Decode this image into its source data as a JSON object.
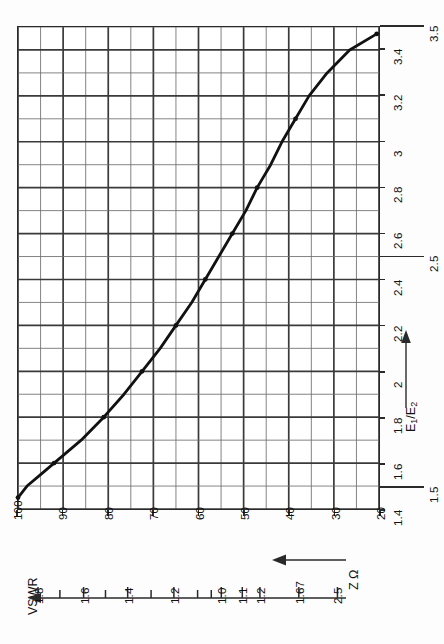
{
  "chart_data": {
    "type": "line",
    "title": "",
    "orientation": "rotated-90",
    "xlabel": "E1/E2",
    "ylabel": "Z Ω",
    "xlim": [
      1.4,
      3.5
    ],
    "ylim": [
      20,
      100
    ],
    "grid": true,
    "legend": "none",
    "x_tick_labels": [
      "1.4",
      "1.5",
      "1.6",
      "1.8",
      "2",
      "2.2",
      "2.4",
      "2.5",
      "2.6",
      "2.8",
      "3",
      "3.2",
      "3.4",
      "3.5"
    ],
    "x_tick_values": [
      1.4,
      1.5,
      1.6,
      1.8,
      2.0,
      2.2,
      2.4,
      2.5,
      2.6,
      2.8,
      3.0,
      3.2,
      3.4,
      3.5
    ],
    "y_tick_labels": [
      "100",
      "90",
      "80",
      "70",
      "60",
      "50",
      "40",
      "30",
      "20"
    ],
    "y_tick_values": [
      100,
      90,
      80,
      70,
      60,
      50,
      40,
      30,
      20
    ],
    "x_major_step": 0.2,
    "x_minor_step": 0.1,
    "y_major_step": 10,
    "y_minor_step": 5,
    "series": [
      {
        "name": "Z vs E1/E2",
        "x": [
          1.45,
          1.5,
          1.55,
          1.6,
          1.65,
          1.7,
          1.75,
          1.8,
          1.9,
          2.0,
          2.1,
          2.2,
          2.3,
          2.4,
          2.5,
          2.6,
          2.7,
          2.8,
          2.9,
          3.0,
          3.1,
          3.2,
          3.3,
          3.4,
          3.47
        ],
        "y": [
          100,
          98,
          95,
          92,
          89,
          86,
          83.5,
          81,
          76.5,
          72.5,
          68.5,
          65,
          61.5,
          58.5,
          55.5,
          52.5,
          49.5,
          47,
          44,
          41.5,
          38.5,
          35.5,
          31.5,
          26.5,
          20.5
        ],
        "markers_x": [
          1.45,
          1.6,
          1.8,
          2.0,
          2.2,
          2.4,
          2.6,
          2.8,
          3.1,
          3.47
        ],
        "markers_y": [
          100,
          92,
          81,
          72.5,
          65,
          58.5,
          52.5,
          47,
          38.5,
          20.5
        ]
      }
    ]
  },
  "axes": {
    "x_axis": {
      "name": "E1/E2",
      "label_main": "E",
      "label_sub1": "1",
      "label_mid": "/E",
      "label_sub2": "2",
      "arrow": "arrow-up-icon",
      "ticks": [
        {
          "value": 1.4,
          "label": "1.4",
          "extended": false
        },
        {
          "value": 1.5,
          "label": "1.5",
          "extended": true
        },
        {
          "value": 1.6,
          "label": "1.6",
          "extended": false
        },
        {
          "value": 1.8,
          "label": "1.8",
          "extended": false
        },
        {
          "value": 2.0,
          "label": "2",
          "extended": false
        },
        {
          "value": 2.2,
          "label": "2.2",
          "extended": false
        },
        {
          "value": 2.4,
          "label": "2.4",
          "extended": false
        },
        {
          "value": 2.5,
          "label": "2.5",
          "extended": true
        },
        {
          "value": 2.6,
          "label": "2.6",
          "extended": false
        },
        {
          "value": 2.8,
          "label": "2.8",
          "extended": false
        },
        {
          "value": 3.0,
          "label": "3",
          "extended": false
        },
        {
          "value": 3.2,
          "label": "3.2",
          "extended": false
        },
        {
          "value": 3.4,
          "label": "3.4",
          "extended": false
        },
        {
          "value": 3.5,
          "label": "3.5",
          "extended": true
        }
      ]
    },
    "y_axis": {
      "name": "Z Ω",
      "label": "Z Ω",
      "arrow": "arrow-left-icon",
      "ticks": [
        {
          "value": 100,
          "label": "100"
        },
        {
          "value": 90,
          "label": "90"
        },
        {
          "value": 80,
          "label": "80"
        },
        {
          "value": 70,
          "label": "70"
        },
        {
          "value": 60,
          "label": "60"
        },
        {
          "value": 50,
          "label": "50"
        },
        {
          "value": 40,
          "label": "40"
        },
        {
          "value": 30,
          "label": "30"
        },
        {
          "value": 20,
          "label": "20"
        }
      ]
    }
  },
  "vswr_scale": {
    "label": "VSWR",
    "arrow": "arrow-left-icon",
    "ticks": [
      {
        "pos": 0.0,
        "label": "1.8",
        "major": true
      },
      {
        "pos": 0.072,
        "label": "",
        "major": false
      },
      {
        "pos": 0.15,
        "label": "1.6",
        "major": true
      },
      {
        "pos": 0.222,
        "label": "",
        "major": false
      },
      {
        "pos": 0.295,
        "label": "1.4",
        "major": true
      },
      {
        "pos": 0.372,
        "label": "",
        "major": false
      },
      {
        "pos": 0.447,
        "label": "1.2",
        "major": true
      },
      {
        "pos": 0.525,
        "label": "",
        "major": false
      },
      {
        "pos": 0.57,
        "label": "",
        "major": false
      },
      {
        "pos": 0.603,
        "label": "1.0",
        "major": true
      },
      {
        "pos": 0.672,
        "label": "1.1",
        "major": true
      },
      {
        "pos": 0.73,
        "label": "1.2",
        "major": true
      },
      {
        "pos": 0.858,
        "label": "1.67",
        "major": true
      },
      {
        "pos": 0.985,
        "label": "2.5",
        "major": true
      }
    ]
  },
  "style": {
    "ink": "#2a2a2a",
    "grid_major": "#3a3a3a",
    "grid_minor": "#6e6e6e",
    "curve": "#111111",
    "paper": "#fdfdfd"
  }
}
